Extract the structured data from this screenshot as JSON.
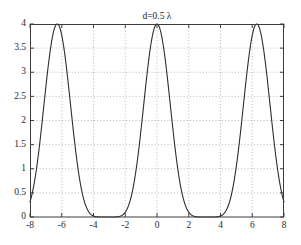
{
  "chart_data": {
    "type": "line",
    "title": "d=0.5 λ",
    "xlabel": "",
    "ylabel": "",
    "xlim": [
      -8,
      8
    ],
    "ylim": [
      0,
      4
    ],
    "xticks": [
      -8,
      -6,
      -4,
      -2,
      0,
      2,
      4,
      6,
      8
    ],
    "xticklabels": [
      "-8",
      "-6",
      "-4",
      "-2",
      "0",
      "2",
      "4",
      "6",
      "8"
    ],
    "yticks": [
      0,
      0.5,
      1,
      1.5,
      2,
      2.5,
      3,
      3.5,
      4
    ],
    "yticklabels": [
      "0",
      "0.5",
      "1",
      "1.5",
      "2",
      "2.5",
      "3",
      "3.5",
      "4"
    ],
    "grid": true,
    "grid_style": "dotted",
    "legend": null,
    "line_color": "#2e2e2e",
    "background": "#ffffff",
    "series": [
      {
        "name": "array factor",
        "formula": "4*cos(x/2)^6",
        "peak_value": 4,
        "peak_x": [
          -6.283,
          -3.142,
          0,
          3.142,
          6.283
        ],
        "zero_x": [
          -7.854,
          -4.712,
          -1.571,
          1.571,
          4.712,
          7.854
        ],
        "period": 3.142,
        "x": [
          -8,
          -7.8,
          -7.6,
          -7.4,
          -7.2,
          -7,
          -6.8,
          -6.6,
          -6.4,
          -6.2,
          -6,
          -5.8,
          -5.6,
          -5.4,
          -5.2,
          -5,
          -4.8,
          -4.6,
          -4.4,
          -4.2,
          -4,
          -3.8,
          -3.6,
          -3.4,
          -3.2,
          -3,
          -2.8,
          -2.6,
          -2.4,
          -2.2,
          -2,
          -1.8,
          -1.6,
          -1.4,
          -1.2,
          -1,
          -0.8,
          -0.6,
          -0.4,
          -0.2,
          0,
          0.2,
          0.4,
          0.6,
          0.8,
          1,
          1.2,
          1.4,
          1.6,
          1.8,
          2,
          2.2,
          2.4,
          2.6,
          2.8,
          3,
          3.2,
          3.4,
          3.6,
          3.8,
          4,
          4.2,
          4.4,
          4.6,
          4.8,
          5,
          5.2,
          5.4,
          5.6,
          5.8,
          6,
          6.2,
          6.4,
          6.6,
          6.8,
          7,
          7.2,
          7.4,
          7.6,
          7.8,
          8
        ],
        "y": [
          0.985,
          1.671,
          2.475,
          3.215,
          3.743,
          3.976,
          3.886,
          3.498,
          2.884,
          2.15,
          1.408,
          0.769,
          0.318,
          0.072,
          0.003,
          0.019,
          0.118,
          0.384,
          0.863,
          1.545,
          2.354,
          3.131,
          3.702,
          3.966,
          3.915,
          3.566,
          2.981,
          2.262,
          1.517,
          0.86,
          0.379,
          0.098,
          0.006,
          0.01,
          0.082,
          0.307,
          0.753,
          1.422,
          2.232,
          3.043,
          4.0,
          3.043,
          2.232,
          1.422,
          0.753,
          0.307,
          0.082,
          0.01,
          0.006,
          0.098,
          0.379,
          0.86,
          1.517,
          2.262,
          2.981,
          3.566,
          3.915,
          3.966,
          3.702,
          3.131,
          2.354,
          1.545,
          0.863,
          0.384,
          0.118,
          0.019,
          0.003,
          0.072,
          0.318,
          0.769,
          1.408,
          2.15,
          2.884,
          3.498,
          3.886,
          3.976,
          3.743,
          3.215,
          2.475,
          1.671,
          0.985
        ]
      }
    ]
  },
  "figure": {
    "plot_left": 30,
    "plot_top": 24,
    "plot_right": 284,
    "plot_bottom": 217
  }
}
